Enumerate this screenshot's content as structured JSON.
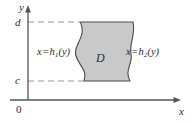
{
  "figure": {
    "type": "type-II-region-diagram",
    "background_color": "#ffffff",
    "axes": {
      "x_axis_label": "x",
      "y_axis_label": "y",
      "origin_label": "0",
      "axis_color": "#555555",
      "x_axis_y_pixel": 100,
      "y_axis_x_pixel": 28
    },
    "ticks": [
      {
        "name": "d",
        "label": "d",
        "y_pixel": 22,
        "description": "upper y bound of region"
      },
      {
        "name": "c",
        "label": "c",
        "y_pixel": 81,
        "description": "lower y bound of region"
      }
    ],
    "region": {
      "label": "D",
      "fill_color": "#c9c9c9",
      "stroke_color": "#4a4a4a",
      "description": "Type II region bounded left by x = h1(y) and right by x = h2(y), between y = c and y = d"
    },
    "curve_labels": {
      "left": {
        "variable": "x",
        "operator": "=",
        "function": "h",
        "subscript": "1",
        "argument": "(y)",
        "full": "x = h1(y)"
      },
      "right": {
        "variable": "x",
        "operator": "=",
        "function": "h",
        "subscript": "2",
        "argument": "(y)",
        "full": "x = h2(y)"
      }
    },
    "dashed_guides": [
      {
        "name": "guide-d",
        "from_x": 28,
        "to_x": 80,
        "y": 22,
        "color": "#9a9a9a"
      },
      {
        "name": "guide-c",
        "from_x": 28,
        "to_x": 80,
        "y": 81,
        "color": "#9a9a9a"
      }
    ]
  }
}
